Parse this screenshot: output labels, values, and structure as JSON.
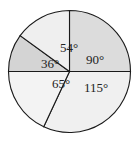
{
  "chart_data": {
    "type": "pie",
    "title": "",
    "start_angle_deg_from_top": 0,
    "direction": "clockwise",
    "slices": [
      {
        "label": "90°",
        "value": 90,
        "color": "#dcdcdc",
        "label_pos": [
          86,
          64
        ]
      },
      {
        "label": "115°",
        "value": 115,
        "color": "#f0f0f0",
        "label_pos": [
          84,
          92
        ]
      },
      {
        "label": "65°",
        "value": 65,
        "color": "#f3f3f3",
        "label_pos": [
          52,
          88
        ]
      },
      {
        "label": "36°",
        "value": 36,
        "color": "#d4d4d4",
        "label_pos": [
          41,
          68
        ]
      },
      {
        "label": "54°",
        "value": 54,
        "color": "#efefef",
        "label_pos": [
          60,
          52
        ]
      }
    ]
  }
}
